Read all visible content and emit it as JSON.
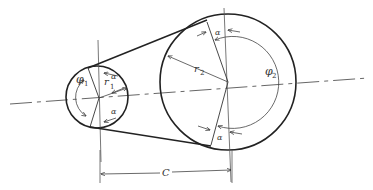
{
  "diagram": {
    "labels": {
      "phi1": "φ",
      "phi1_sub": "1",
      "r1": "r",
      "r1_sub": "1",
      "phi2": "φ",
      "phi2_sub": "2",
      "r2": "r",
      "r2_sub": "2",
      "alpha": "α",
      "center_distance": "C"
    },
    "colors": {
      "stroke": "#222222",
      "thin": "#444444",
      "background": "#ffffff"
    }
  }
}
